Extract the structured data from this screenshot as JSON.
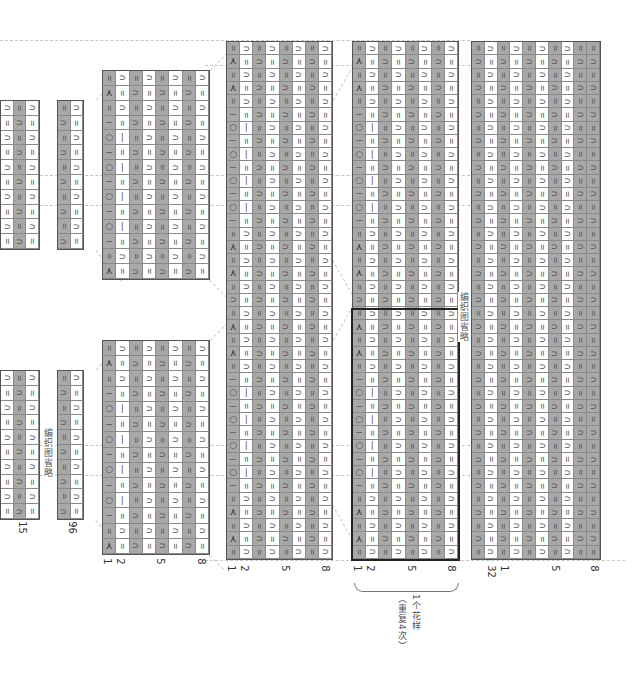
{
  "chart_title": "knitting chart (rotated 90°)",
  "legend_symbols": {
    "knit": "∩",
    "purl": "−",
    "yarn_over": "○",
    "single_purl": "|",
    "decrease": "⋏"
  },
  "colors": {
    "dark_cell": "#a8a8a8",
    "light_cell": "#ffffff",
    "grid": "#8a8a8a",
    "border": "#555555",
    "highlight_border": "#222222"
  },
  "labels": {
    "omitted_chart_1": "编织图省略",
    "omitted_chart_2": "编织图省略",
    "pattern_repeat_1": "1个花样",
    "pattern_repeat_2": "（重复4次）"
  },
  "panels": [
    {
      "id": "A-top",
      "cols": 3,
      "rows": 10,
      "type": "rib3"
    },
    {
      "id": "A2-top",
      "cols": 2,
      "rows": 10,
      "type": "rib2"
    },
    {
      "id": "A-bottom",
      "cols": 3,
      "rows": 10,
      "type": "rib3"
    },
    {
      "id": "A2-bottom",
      "cols": 2,
      "rows": 10,
      "type": "rib2"
    },
    {
      "id": "B-top",
      "cols": 8,
      "rows": 14,
      "type": "lace"
    },
    {
      "id": "B-bottom",
      "cols": 8,
      "rows": 14,
      "type": "lace"
    },
    {
      "id": "C",
      "cols": 8,
      "rows": 39,
      "type": "lace-long"
    },
    {
      "id": "D",
      "cols": 8,
      "rows": 39,
      "type": "lace-long"
    },
    {
      "id": "E",
      "cols": 10,
      "rows": 39,
      "type": "rib10"
    }
  ],
  "axis_numbers": {
    "A": [
      "15"
    ],
    "A2": [
      "96"
    ],
    "B": [
      "1",
      "2",
      "5",
      "8"
    ],
    "C": [
      "1",
      "2",
      "5",
      "8"
    ],
    "D": [
      "1",
      "2",
      "5",
      "8"
    ],
    "E": [
      "32",
      "1",
      "5",
      "8"
    ]
  }
}
